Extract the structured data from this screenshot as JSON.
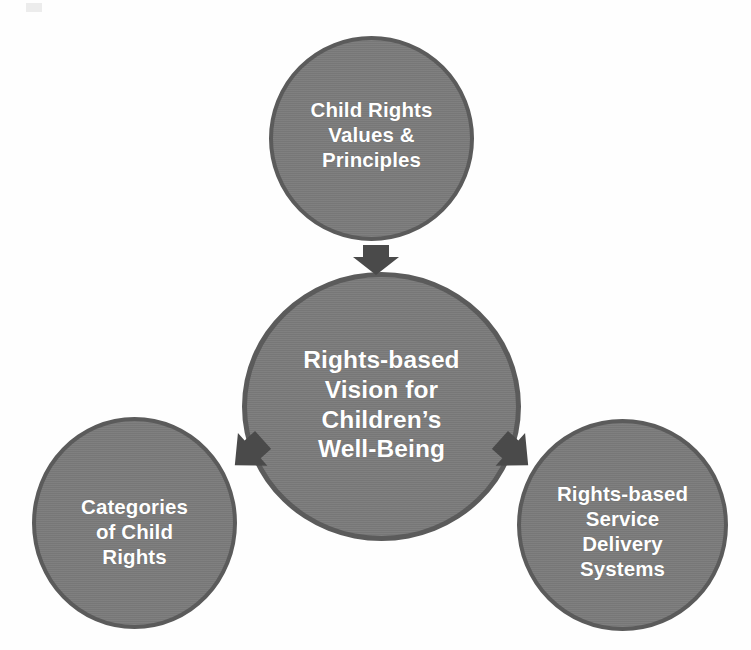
{
  "diagram": {
    "background_color": "#fefefe",
    "node_fill_color": "#7b7b7b",
    "node_border_color": "#5b5b5b",
    "node_text_color": "#ffffff",
    "arrow_color": "#4a4a4a",
    "nodes": {
      "top": {
        "name": "child-rights-values-and-principles",
        "label": "Child Rights\nValues &\nPrinciples",
        "lines": [
          "Child Rights",
          "Values &",
          "Principles"
        ]
      },
      "center": {
        "name": "rights-based-vision-for-childrens-well-being",
        "label": "Rights-based\nVision for\nChildren’s\nWell-Being",
        "lines": [
          "Rights-based",
          "Vision for",
          "Children’s",
          "Well-Being"
        ]
      },
      "left": {
        "name": "categories-of-child-rights",
        "label": "Categories\nof Child\nRights",
        "lines": [
          "Categories",
          "of Child",
          "Rights"
        ]
      },
      "right": {
        "name": "rights-based-service-delivery-systems",
        "label": "Rights-based\nService\nDelivery\nSystems",
        "lines": [
          "Rights-based",
          "Service",
          "Delivery",
          "Systems"
        ]
      }
    },
    "arrows": [
      {
        "name": "arrow-top-to-center",
        "from": "top",
        "to": "center",
        "direction": "down"
      },
      {
        "name": "arrow-left-to-center",
        "from": "left",
        "to": "center",
        "direction": "up-right"
      },
      {
        "name": "arrow-right-to-center",
        "from": "right",
        "to": "center",
        "direction": "up-left"
      }
    ]
  }
}
